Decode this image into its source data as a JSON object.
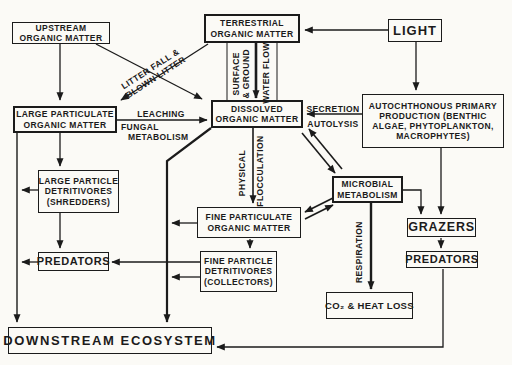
{
  "diagram": {
    "colors": {
      "ink": "#1b1b1b",
      "paper": "#fbfaf6"
    },
    "boxes": {
      "upstream": {
        "lines": [
          "UPSTREAM",
          "ORGANIC MATTER"
        ]
      },
      "terrestrial": {
        "lines": [
          "TERRESTRIAL",
          "ORGANIC MATTER"
        ]
      },
      "light": {
        "lines": [
          "LIGHT"
        ]
      },
      "lpom": {
        "lines": [
          "LARGE PARTICULATE",
          "ORGANIC MATTER"
        ]
      },
      "dissolved": {
        "lines": [
          "DISSOLVED",
          "ORGANIC MATTER"
        ]
      },
      "autochthonous": {
        "lines": [
          "AUTOCHTHONOUS PRIMARY",
          "PRODUCTION (BENTHIC",
          "ALGAE, PHYTOPLANKTON,",
          "MACROPHYTES)"
        ]
      },
      "shredders": {
        "lines": [
          "LARGE PARTICLE",
          "DETRITIVORES",
          "(SHREDDERS)"
        ]
      },
      "microbial": {
        "lines": [
          "MICROBIAL",
          "METABOLISM"
        ]
      },
      "fpom": {
        "lines": [
          "FINE PARTICULATE",
          "ORGANIC MATTER"
        ]
      },
      "grazers": {
        "lines": [
          "GRAZERS"
        ]
      },
      "predators_right": {
        "lines": [
          "PREDATORS"
        ]
      },
      "predators_left": {
        "lines": [
          "PREDATORS"
        ]
      },
      "collectors": {
        "lines": [
          "FINE PARTICLE",
          "DETRITIVORES",
          "(COLLECTORS)"
        ]
      },
      "co2": {
        "lines": [
          "CO₂ & HEAT LOSS"
        ]
      },
      "downstream": {
        "lines": [
          "DOWNSTREAM ECOSYSTEM"
        ]
      }
    },
    "edge_labels": {
      "litter_fall": "LITTER FALL &",
      "blown_litter": "BLOWN LITTER",
      "leaching": "LEACHING",
      "fungal_1": "FUNGAL",
      "fungal_2": "METABOLISM",
      "surface_1": "SURFACE",
      "surface_2": "& GROUND",
      "water_flow": "WATER FLOW",
      "secretion": "SECRETION",
      "autolysis": "AUTOLYSIS",
      "physical": "PHYSICAL",
      "flocculation": "FLOCCULATION",
      "respiration": "RESPIRATION"
    }
  }
}
